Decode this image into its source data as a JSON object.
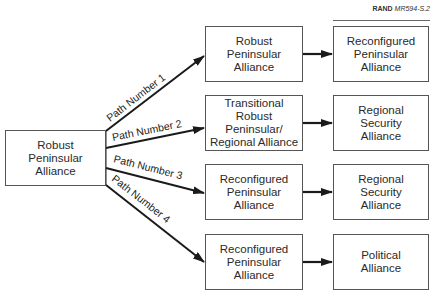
{
  "credit": {
    "publisher": "RAND",
    "code": "MR594-S.2"
  },
  "source": {
    "label": "Robust\nPeninsular\nAlliance"
  },
  "paths": [
    {
      "label": "Path Number 1",
      "intermediate": "Robust\nPeninsular\nAlliance",
      "outcome": "Reconfigured\nPeninsular\nAlliance"
    },
    {
      "label": "Path Number 2",
      "intermediate": "Transitional\nRobust\nPeninsular/\nRegional Alliance",
      "outcome": "Regional\nSecurity\nAlliance"
    },
    {
      "label": "Path Number 3",
      "intermediate": "Reconfigured\nPeninsular\nAlliance",
      "outcome": "Regional\nSecurity\nAlliance"
    },
    {
      "label": "Path Number 4",
      "intermediate": "Reconfigured\nPeninsular\nAlliance",
      "outcome": "Political\nAlliance"
    }
  ],
  "colors": {
    "line": "#1a1a1a",
    "border": "#555555"
  }
}
